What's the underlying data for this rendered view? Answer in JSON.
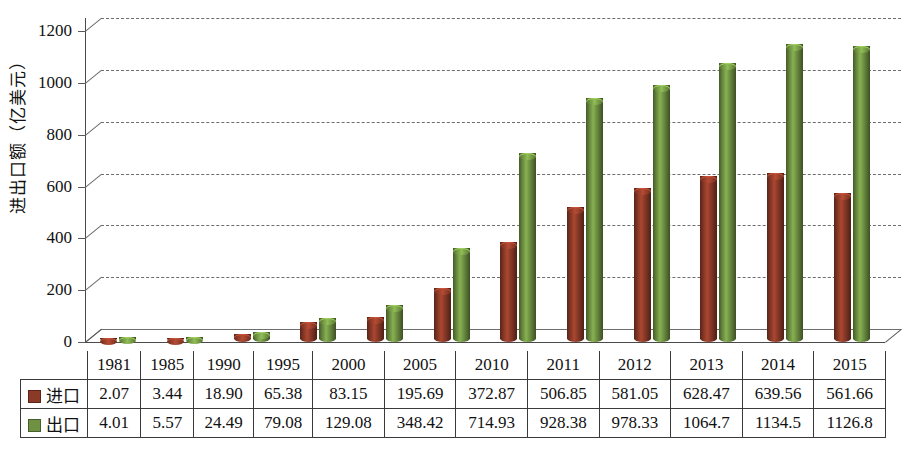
{
  "chart_data": {
    "type": "bar",
    "title": "",
    "subtitle": "",
    "xlabel": "",
    "ylabel": "进出口额（亿美元）",
    "ylim": [
      0,
      1200
    ],
    "yticks": [
      0,
      200,
      400,
      600,
      800,
      1000,
      1200
    ],
    "ytick_labels": [
      "0",
      "200",
      "400",
      "600",
      "800",
      "1000",
      "1200"
    ],
    "grid": true,
    "legend_position": "table-row-header",
    "style": "3d-cylinder",
    "categories": [
      "1981",
      "1985",
      "1990",
      "1995",
      "2000",
      "2005",
      "2010",
      "2011",
      "2012",
      "2013",
      "2014",
      "2015"
    ],
    "series": [
      {
        "name": "进口",
        "color": "#8c3a28",
        "values": [
          2.07,
          3.44,
          18.9,
          65.38,
          83.15,
          195.69,
          372.87,
          506.85,
          581.05,
          628.47,
          639.56,
          561.66
        ],
        "value_labels": [
          "2.07",
          "3.44",
          "18.90",
          "65.38",
          "83.15",
          "195.69",
          "372.87",
          "506.85",
          "581.05",
          "628.47",
          "639.56",
          "561.66"
        ]
      },
      {
        "name": "出口",
        "color": "#6f9142",
        "values": [
          4.01,
          5.57,
          24.49,
          79.08,
          129.08,
          348.42,
          714.93,
          928.38,
          978.33,
          1064.7,
          1134.5,
          1126.8
        ],
        "value_labels": [
          "4.01",
          "5.57",
          "24.49",
          "79.08",
          "129.08",
          "348.42",
          "714.93",
          "928.38",
          "978.33",
          "1064.7",
          "1134.5",
          "1126.8"
        ]
      }
    ]
  },
  "table": {
    "corner_label": "",
    "column_headers": [
      "1981",
      "1985",
      "1990",
      "1995",
      "2000",
      "2005",
      "2010",
      "2011",
      "2012",
      "2013",
      "2014",
      "2015"
    ],
    "rows": [
      {
        "label": "进口",
        "swatch_color": "#8c3a28",
        "cells": [
          "2.07",
          "3.44",
          "18.90",
          "65.38",
          "83.15",
          "195.69",
          "372.87",
          "506.85",
          "581.05",
          "628.47",
          "639.56",
          "561.66"
        ]
      },
      {
        "label": "出口",
        "swatch_color": "#6f9142",
        "cells": [
          "4.01",
          "5.57",
          "24.49",
          "79.08",
          "129.08",
          "348.42",
          "714.93",
          "928.38",
          "978.33",
          "1064.7",
          "1134.5",
          "1126.8"
        ]
      }
    ]
  },
  "colors": {
    "import": "#8c3a28",
    "export": "#6f9142",
    "axis": "#4a4a4a",
    "grid": "#6d6d6d",
    "background": "#ffffff"
  }
}
